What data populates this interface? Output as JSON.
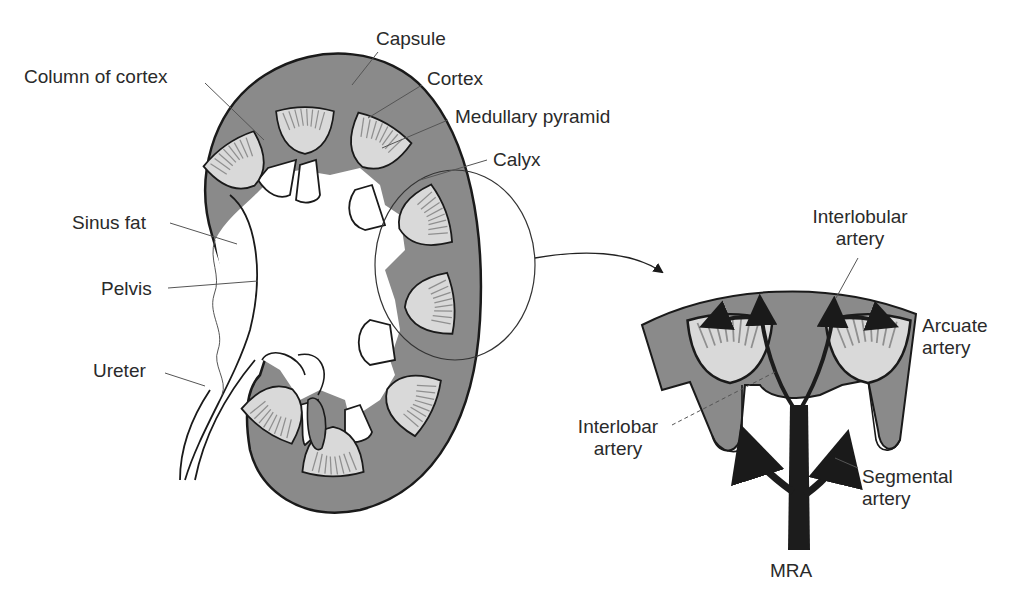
{
  "figure": {
    "title_cropped": "",
    "kidney_labels": {
      "capsule": "Capsule",
      "column_of_cortex": "Column of cortex",
      "cortex": "Cortex",
      "medullary_pyramid": "Medullary pyramid",
      "calyx": "Calyx",
      "sinus_fat": "Sinus fat",
      "pelvis": "Pelvis",
      "ureter": "Ureter"
    },
    "detail_labels": {
      "interlobular_artery": [
        "Interlobular",
        "artery"
      ],
      "arcuate_artery": [
        "Arcuate",
        "artery"
      ],
      "interlobar_artery": [
        "Interlobar",
        "artery"
      ],
      "segmental_artery": [
        "Segmental",
        "artery"
      ],
      "mra": "MRA"
    },
    "colors": {
      "cortex_fill": "#8a8a8a",
      "pyramid_fill": "#d9d9d9",
      "outline": "#1a1a1a",
      "artery": "#1c1c1c",
      "leader_line": "#555555",
      "background": "#ffffff"
    }
  }
}
